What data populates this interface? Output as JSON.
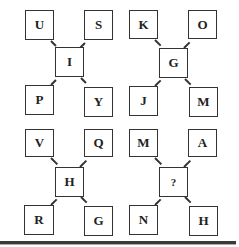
{
  "puzzle": {
    "panels": [
      {
        "top_left": "U",
        "top_right": "S",
        "center": "I",
        "bottom_left": "P",
        "bottom_right": "Y"
      },
      {
        "top_left": "K",
        "top_right": "O",
        "center": "G",
        "bottom_left": "J",
        "bottom_right": "M"
      },
      {
        "top_left": "V",
        "top_right": "Q",
        "center": "H",
        "bottom_left": "R",
        "bottom_right": "G"
      },
      {
        "top_left": "M",
        "top_right": "A",
        "center": "?",
        "bottom_left": "N",
        "bottom_right": "H"
      }
    ]
  }
}
